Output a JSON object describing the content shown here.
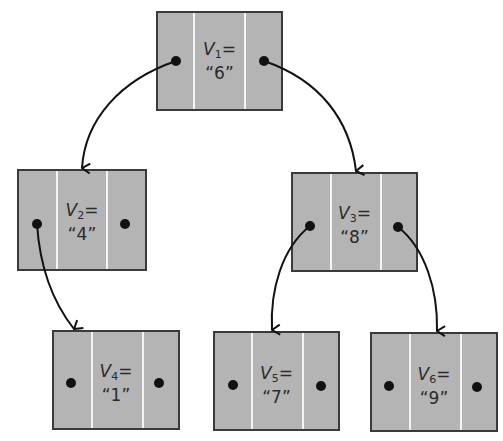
{
  "diagram": {
    "type": "binary-tree",
    "colors": {
      "node_fill": "#b4b4b4",
      "node_border": "#3a3a3a",
      "divider": "#f4f4f4",
      "edge": "#111111"
    },
    "nodes": [
      {
        "id": "V1",
        "var": "V",
        "sub": "1",
        "eq": "=",
        "value": "“6”"
      },
      {
        "id": "V2",
        "var": "V",
        "sub": "2",
        "eq": "=",
        "value": "“4”"
      },
      {
        "id": "V3",
        "var": "V",
        "sub": "3",
        "eq": "=",
        "value": "“8”"
      },
      {
        "id": "V4",
        "var": "V",
        "sub": "4",
        "eq": "=",
        "value": "“1”"
      },
      {
        "id": "V5",
        "var": "V",
        "sub": "5",
        "eq": "=",
        "value": "“7”"
      },
      {
        "id": "V6",
        "var": "V",
        "sub": "6",
        "eq": "=",
        "value": "“9”"
      }
    ],
    "edges": [
      {
        "from": "V1",
        "side": "left",
        "to": "V2"
      },
      {
        "from": "V1",
        "side": "right",
        "to": "V3"
      },
      {
        "from": "V2",
        "side": "left",
        "to": "V4"
      },
      {
        "from": "V3",
        "side": "left",
        "to": "V5"
      },
      {
        "from": "V3",
        "side": "right",
        "to": "V6"
      }
    ]
  }
}
